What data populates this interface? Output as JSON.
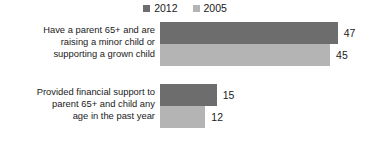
{
  "chart_data": {
    "type": "bar",
    "orientation": "horizontal",
    "title": "",
    "subtitle": "",
    "xlabel": "",
    "ylabel": "",
    "grid": false,
    "legend_position": "top-center",
    "xlim": [
      0,
      50
    ],
    "categories": [
      "Have a parent 65+ and are raising a minor child or supporting a grown child",
      "Provided financial support to parent 65+ and child any age in the past year"
    ],
    "series": [
      {
        "name": "2012",
        "color": "#6d6d6d",
        "values": [
          47,
          15
        ]
      },
      {
        "name": "2005",
        "color": "#b4b4b4",
        "values": [
          45,
          12
        ]
      }
    ]
  },
  "legend": {
    "items": [
      {
        "label": "2012",
        "color": "#6d6d6d",
        "swatch_icon": "square-swatch-icon"
      },
      {
        "label": "2005",
        "color": "#b4b4b4",
        "swatch_icon": "square-swatch-icon"
      }
    ]
  },
  "groups": [
    {
      "label_lines": [
        "Have a parent 65+ and are",
        "raising a minor child or",
        "supporting a grown child"
      ],
      "label_text": "Have a parent 65+ and are raising a minor child or supporting a grown child",
      "bars": [
        {
          "series": "2012",
          "value": 47,
          "value_label": "47",
          "color": "#6d6d6d"
        },
        {
          "series": "2005",
          "value": 45,
          "value_label": "45",
          "color": "#b4b4b4"
        }
      ]
    },
    {
      "label_lines": [
        "Provided financial support to",
        "parent 65+ and child any",
        "age in the past year"
      ],
      "label_text": "Provided financial support to parent 65+ and child any age in the past year",
      "bars": [
        {
          "series": "2012",
          "value": 15,
          "value_label": "15",
          "color": "#6d6d6d"
        },
        {
          "series": "2005",
          "value": 12,
          "value_label": "12",
          "color": "#b4b4b4"
        }
      ]
    }
  ],
  "scale": {
    "pixels_per_unit": 3.78,
    "plot_left_px": 160
  }
}
